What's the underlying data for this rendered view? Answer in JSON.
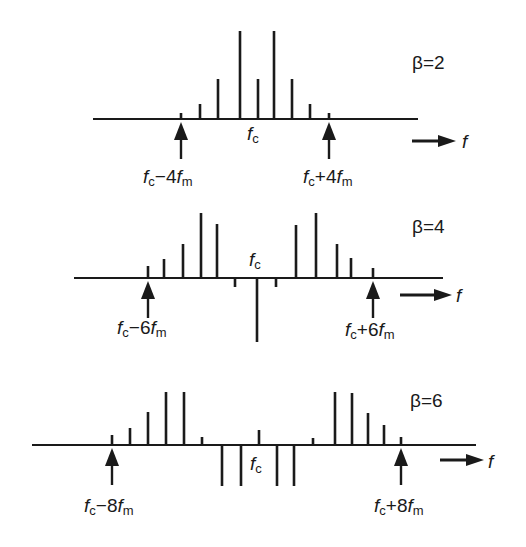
{
  "figure": {
    "ink_color": "#1a1a1a",
    "background": "#ffffff",
    "freq_axis_label": "f",
    "carrier_label": "f",
    "carrier_sub": "c",
    "panels": [
      {
        "beta_label": "β=2",
        "left_marker": {
          "main": "f",
          "sub1": "c",
          "op": "−4",
          "f2": "f",
          "sub2": "m"
        },
        "right_marker": {
          "main": "f",
          "sub1": "c",
          "op": "+4",
          "f2": "f",
          "sub2": "m"
        }
      },
      {
        "beta_label": "β=4",
        "left_marker": {
          "main": "f",
          "sub1": "c",
          "op": "−6",
          "f2": "f",
          "sub2": "m"
        },
        "right_marker": {
          "main": "f",
          "sub1": "c",
          "op": "+6",
          "f2": "f",
          "sub2": "m"
        }
      },
      {
        "beta_label": "β=6",
        "left_marker": {
          "main": "f",
          "sub1": "c",
          "op": "−8",
          "f2": "f",
          "sub2": "m"
        },
        "right_marker": {
          "main": "f",
          "sub1": "c",
          "op": "+8",
          "f2": "f",
          "sub2": "m"
        }
      }
    ]
  },
  "chart_data": [
    {
      "type": "bar",
      "title": "β=2",
      "xlabel": "f",
      "categories": [
        "fc-4fm",
        "fc-3fm",
        "fc-2fm",
        "fc-fm",
        "fc",
        "fc+fm",
        "fc+2fm",
        "fc+3fm",
        "fc+4fm"
      ],
      "values": [
        6,
        15,
        40,
        88,
        40,
        88,
        40,
        15,
        6
      ],
      "x_px": [
        181,
        200,
        218,
        240,
        258,
        274,
        292,
        310,
        329
      ],
      "baseline_y": 119,
      "axis_x": [
        93,
        418
      ],
      "markers": {
        "left_x": 181,
        "right_x": 329
      },
      "fc_x": 251
    },
    {
      "type": "bar",
      "title": "β=4",
      "xlabel": "f",
      "categories": [
        "fc-6fm",
        "fc-5fm",
        "fc-4fm",
        "fc-3fm",
        "fc-2fm",
        "fc-fm",
        "fc",
        "fc+fm",
        "fc+2fm",
        "fc+3fm",
        "fc+4fm",
        "fc+5fm",
        "fc+6fm"
      ],
      "values": [
        12,
        19,
        34,
        65,
        54,
        -9,
        -64,
        -9,
        53,
        65,
        34,
        20,
        10
      ],
      "x_px": [
        148,
        164,
        183,
        201,
        217,
        235,
        257,
        276,
        296,
        316,
        337,
        351,
        373
      ],
      "baseline_y": 278,
      "axis_x": [
        74,
        443
      ],
      "markers": {
        "left_x": 148,
        "right_x": 373
      },
      "fc_x": 257
    },
    {
      "type": "bar",
      "title": "β=6",
      "xlabel": "f",
      "categories": [
        "fc-8fm",
        "fc-7fm",
        "fc-6fm",
        "fc-5fm",
        "fc-4fm",
        "fc-3fm",
        "fc-2fm",
        "fc-fm",
        "fc",
        "fc+fm",
        "fc+2fm",
        "fc+3fm",
        "fc+4fm",
        "fc+5fm",
        "fc+6fm",
        "fc+7fm",
        "fc+8fm"
      ],
      "values": [
        10,
        17,
        33,
        53,
        53,
        8,
        -41,
        -41,
        15,
        -41,
        -41,
        7,
        53,
        52,
        32,
        20,
        8
      ],
      "x_px": [
        112,
        130,
        148,
        166,
        184,
        202,
        222,
        241,
        259,
        277,
        294,
        313,
        335,
        352,
        368,
        384,
        401
      ],
      "baseline_y": 445,
      "axis_x": [
        32,
        476
      ],
      "markers": {
        "left_x": 112,
        "right_x": 401
      },
      "fc_x": 259
    }
  ]
}
